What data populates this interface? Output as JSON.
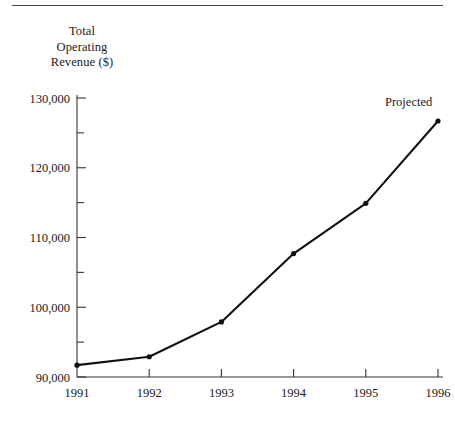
{
  "figure": {
    "rule_color": "#4a4a4a",
    "line_color": "#111111",
    "axis_color": "#333333",
    "background": "#ffffff"
  },
  "axis_title": "Total\nOperating\nRevenue ($)",
  "annotation": {
    "projected_label": "Projected"
  },
  "chart_data": {
    "type": "line",
    "title": "",
    "xlabel": "",
    "ylabel": "Total Operating Revenue ($)",
    "categories": [
      "1991",
      "1992",
      "1993",
      "1994",
      "1995",
      "1996"
    ],
    "x": [
      1991,
      1992,
      1993,
      1994,
      1995,
      1996
    ],
    "values": [
      91700,
      92900,
      97900,
      107700,
      114900,
      126700
    ],
    "series": [
      {
        "name": "Total Operating Revenue ($)",
        "values": [
          91700,
          92900,
          97900,
          107700,
          114900,
          126700
        ]
      }
    ],
    "ylim": [
      90000,
      131000
    ],
    "xlim": [
      1991,
      1996
    ],
    "ytick_labels": [
      "90,000",
      "100,000",
      "110,000",
      "120,000",
      "130,000"
    ],
    "ytick_values": [
      90000,
      100000,
      110000,
      120000,
      130000
    ],
    "yminor_values": [
      95000,
      105000,
      115000,
      125000
    ],
    "xtick_labels": [
      "1991",
      "1992",
      "1993",
      "1994",
      "1995",
      "1996"
    ],
    "grid": false,
    "legend": "none",
    "markers": true,
    "annotations": [
      {
        "text": "Projected",
        "x": 1996,
        "y": 126700
      }
    ]
  }
}
